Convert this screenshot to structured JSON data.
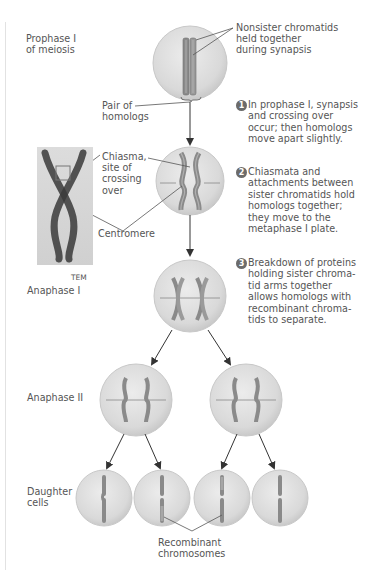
{
  "stages": {
    "prophase": "Prophase I\nof meiosis",
    "prophase_line1": "Prophase I",
    "prophase_line2": "of meiosis",
    "anaphase1": "Anaphase I",
    "anaphase2": "Anaphase II",
    "daughter_line1": "Daughter",
    "daughter_line2": "cells"
  },
  "callouts": {
    "nonsister_line1": "Nonsister chromatids",
    "nonsister_line2": "held together",
    "nonsister_line3": "during synapsis",
    "pair_line1": "Pair of",
    "pair_line2": "homologs",
    "chiasma_line1": "Chiasma,",
    "chiasma_line2": "site of",
    "chiasma_line3": "crossing",
    "chiasma_line4": "over",
    "centromere": "Centromere",
    "tem": "TEM",
    "recombinant_line1": "Recombinant",
    "recombinant_line2": "chromosomes"
  },
  "steps": [
    {
      "number": "1",
      "lines": [
        "In prophase I, synapsis",
        "and crossing over",
        "occur; then homologs",
        "move apart slightly."
      ]
    },
    {
      "number": "2",
      "lines": [
        "Chiasmata and",
        "attachments between",
        "sister chromatids hold",
        "homologs together;",
        "they move to the",
        "metaphase I plate."
      ]
    },
    {
      "number": "3",
      "lines": [
        "Breakdown of proteins",
        "holding sister chroma-",
        "tid arms together",
        "allows homologs with",
        "recombinant chroma-",
        "tids to separate."
      ]
    }
  ],
  "colors": {
    "cell_fill": "#dcdcdc",
    "cell_edge": "#c4c4c4",
    "chromosome": "#8a8a8a",
    "arrow": "#333333"
  }
}
